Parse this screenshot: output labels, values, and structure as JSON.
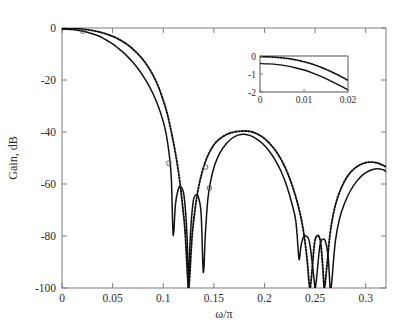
{
  "figure": {
    "background_color": "#ffffff",
    "curve_color": "#111111",
    "axis_color": "#7d7d7d",
    "text_color": "#2b2b2b"
  },
  "chart_data": {
    "type": "line",
    "title": "",
    "subtitle": "",
    "xlabel": "ω/π",
    "ylabel": "Gain, dB",
    "xlim": [
      0,
      0.32
    ],
    "ylim": [
      -100,
      0
    ],
    "grid": false,
    "legend_position": "none",
    "xticks": [
      0,
      0.05,
      0.1,
      0.15,
      0.2,
      0.25,
      0.3
    ],
    "xticklabels": [
      "0",
      "0.05",
      "0.1",
      "0.15",
      "0.2",
      "0.25",
      "0.3"
    ],
    "yticks": [
      0,
      -20,
      -40,
      -60,
      -80,
      -100
    ],
    "yticklabels": [
      "0",
      "-20",
      "-40",
      "-60",
      "-80",
      "-100"
    ],
    "annotations": [
      "Solid and dotted magnitude responses nearly coincide in the passband",
      "Deep stopband nulls clipped at -100 dB"
    ],
    "series": [
      {
        "name": "solid-response",
        "style": "solid",
        "color": "#111111",
        "x": [
          0,
          0.005,
          0.01,
          0.015,
          0.02,
          0.025,
          0.03,
          0.035,
          0.04,
          0.045,
          0.05,
          0.055,
          0.06,
          0.065,
          0.07,
          0.075,
          0.08,
          0.085,
          0.09,
          0.095,
          0.1,
          0.103,
          0.106,
          0.108,
          0.1095,
          0.1105,
          0.112,
          0.1145,
          0.117,
          0.1205,
          0.1235,
          0.1248,
          0.1252,
          0.1265,
          0.1295,
          0.1325,
          0.135,
          0.1375,
          0.1392,
          0.1402,
          0.1415,
          0.144,
          0.147,
          0.151,
          0.156,
          0.162,
          0.168,
          0.174,
          0.18,
          0.186,
          0.192,
          0.198,
          0.204,
          0.21,
          0.216,
          0.222,
          0.227,
          0.231,
          0.2338,
          0.2348,
          0.236,
          0.2385,
          0.241,
          0.2445,
          0.2485,
          0.2498,
          0.2502,
          0.2515,
          0.2548,
          0.258,
          0.2605,
          0.263,
          0.2648,
          0.2658,
          0.267,
          0.27,
          0.274,
          0.279,
          0.285,
          0.291,
          0.297,
          0.303,
          0.309,
          0.314,
          0.318,
          0.32
        ],
        "y": [
          -0.45,
          -0.5,
          -0.62,
          -0.85,
          -1.15,
          -1.6,
          -2.2,
          -2.9,
          -3.8,
          -4.9,
          -6.1,
          -7.6,
          -9.2,
          -11.1,
          -13.2,
          -15.6,
          -18.4,
          -21.6,
          -25.4,
          -30.0,
          -36.0,
          -41.0,
          -49.0,
          -58.0,
          -78.0,
          -78.0,
          -68.0,
          -62.5,
          -61.0,
          -64.5,
          -80.0,
          -100,
          -100,
          -82.0,
          -67.0,
          -64.2,
          -65.5,
          -72.0,
          -92.0,
          -92.0,
          -80.0,
          -66.0,
          -58.5,
          -52.5,
          -48.0,
          -44.6,
          -42.4,
          -41.2,
          -40.9,
          -41.4,
          -42.6,
          -44.4,
          -47.0,
          -50.4,
          -54.8,
          -60.8,
          -67.5,
          -74.5,
          -88.0,
          -88.0,
          -84.0,
          -80.4,
          -80.0,
          -82.5,
          -95.0,
          -100,
          -100,
          -96.0,
          -83.5,
          -81.2,
          -82.5,
          -88.5,
          -100,
          -100,
          -95.0,
          -82.0,
          -73.5,
          -67.5,
          -62.5,
          -59.0,
          -56.5,
          -55.0,
          -54.2,
          -54.2,
          -54.6,
          -55.2
        ]
      },
      {
        "name": "dotted-response",
        "style": "dotted",
        "color": "#111111",
        "x": [
          0,
          0.005,
          0.01,
          0.015,
          0.02,
          0.025,
          0.03,
          0.035,
          0.04,
          0.045,
          0.05,
          0.055,
          0.06,
          0.065,
          0.07,
          0.075,
          0.08,
          0.085,
          0.09,
          0.095,
          0.1,
          0.104,
          0.108,
          0.112,
          0.116,
          0.119,
          0.1215,
          0.1238,
          0.1248,
          0.1252,
          0.1262,
          0.1285,
          0.131,
          0.134,
          0.138,
          0.142,
          0.147,
          0.152,
          0.158,
          0.164,
          0.17,
          0.176,
          0.181,
          0.187,
          0.193,
          0.199,
          0.205,
          0.211,
          0.217,
          0.223,
          0.229,
          0.234,
          0.238,
          0.2418,
          0.2438,
          0.2448,
          0.2452,
          0.2468,
          0.2495,
          0.2525,
          0.2552,
          0.2572,
          0.2582,
          0.2592,
          0.2615,
          0.2645,
          0.268,
          0.272,
          0.277,
          0.283,
          0.289,
          0.295,
          0.301,
          0.307,
          0.312,
          0.316,
          0.32
        ],
        "y": [
          -0.05,
          -0.08,
          -0.14,
          -0.26,
          -0.43,
          -0.66,
          -0.97,
          -1.36,
          -1.85,
          -2.46,
          -3.2,
          -4.1,
          -5.2,
          -6.5,
          -8.1,
          -10.0,
          -12.2,
          -14.9,
          -18.2,
          -22.4,
          -27.8,
          -33.0,
          -40.0,
          -48.0,
          -58.0,
          -68.0,
          -78.0,
          -94.0,
          -100,
          -100,
          -95.0,
          -80.0,
          -71.0,
          -63.0,
          -56.0,
          -51.0,
          -46.8,
          -44.0,
          -42.0,
          -40.7,
          -40.0,
          -39.7,
          -39.6,
          -39.9,
          -40.8,
          -42.2,
          -44.4,
          -47.2,
          -51.0,
          -56.0,
          -62.5,
          -69.5,
          -77.0,
          -88.0,
          -97.0,
          -100,
          -100,
          -94.0,
          -82.5,
          -79.8,
          -82.0,
          -90.0,
          -96.0,
          -100,
          -92.0,
          -80.0,
          -71.5,
          -65.5,
          -60.5,
          -56.5,
          -54.0,
          -52.5,
          -51.7,
          -51.6,
          -52.0,
          -52.6,
          -53.4
        ]
      }
    ],
    "markers": [
      {
        "x": 0.0205,
        "y": -1.2,
        "r": 2.3
      },
      {
        "x": 0.1055,
        "y": -52.0,
        "r": 2.3
      },
      {
        "x": 0.1418,
        "y": -53.5,
        "r": 2.3
      },
      {
        "x": 0.1455,
        "y": -61.5,
        "r": 2.3
      }
    ],
    "inset": {
      "name": "passband-detail-inset",
      "xlim": [
        0,
        0.02
      ],
      "ylim": [
        -2,
        0
      ],
      "xticks": [
        0,
        0.01,
        0.02
      ],
      "xticklabels": [
        "0",
        "0.01",
        "0.02"
      ],
      "yticks": [
        0,
        -1,
        -2
      ],
      "yticklabels": [
        "0",
        "-1",
        "-2"
      ],
      "series": [
        {
          "name": "inset-solid-response",
          "style": "solid",
          "x": [
            0,
            0.002,
            0.004,
            0.006,
            0.008,
            0.01,
            0.012,
            0.014,
            0.016,
            0.018,
            0.02
          ],
          "y": [
            -0.42,
            -0.44,
            -0.48,
            -0.55,
            -0.65,
            -0.78,
            -0.95,
            -1.15,
            -1.38,
            -1.62,
            -1.88
          ]
        },
        {
          "name": "inset-dotted-response",
          "style": "dotted",
          "x": [
            0,
            0.002,
            0.004,
            0.006,
            0.008,
            0.01,
            0.012,
            0.014,
            0.016,
            0.018,
            0.02
          ],
          "y": [
            -0.04,
            -0.05,
            -0.08,
            -0.13,
            -0.21,
            -0.32,
            -0.46,
            -0.64,
            -0.85,
            -1.09,
            -1.35
          ]
        }
      ]
    }
  }
}
